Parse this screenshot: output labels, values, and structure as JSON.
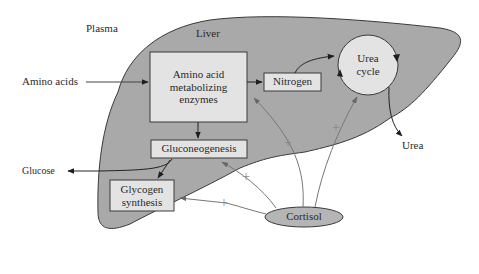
{
  "regions": {
    "plasma": "Plasma",
    "liver": "Liver"
  },
  "nodes": {
    "amino_enzymes": {
      "line1": "Amino acid",
      "line2": "metabolizing",
      "line3": "enzymes"
    },
    "nitrogen": "Nitrogen",
    "urea_cycle": {
      "line1": "Urea",
      "line2": "cycle"
    },
    "gluconeogenesis": "Gluconeogenesis",
    "glycogen": {
      "line1": "Glycogen",
      "line2": "synthesis"
    },
    "cortisol": "Cortisol"
  },
  "external": {
    "amino_acids": "Amino acids",
    "glucose": "Glucose",
    "urea": "Urea"
  },
  "stimulation_symbol": "+",
  "colors": {
    "liver_fill": "#a9a9a9",
    "box_fill": "#e3e3e3",
    "cortisol_fill": "#b5b5b5",
    "stroke": "#3a3a3a",
    "stim_line": "#777777"
  }
}
